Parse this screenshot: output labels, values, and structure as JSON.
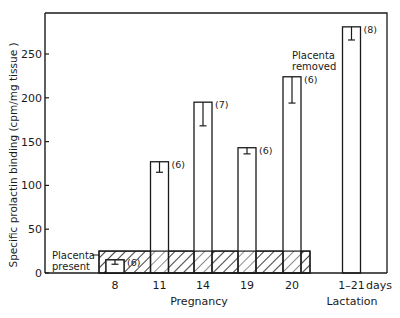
{
  "chart_data": {
    "type": "bar",
    "title": "",
    "xlabel_groups": [
      {
        "label": "Pregnancy",
        "categories": [
          "8",
          "11",
          "14",
          "19",
          "20"
        ]
      },
      {
        "label": "Lactation",
        "categories": [
          "1–21"
        ]
      }
    ],
    "x_unit_label": "days",
    "ylabel": "Specific prolactin binding  (cpm/mg tissue )",
    "ylim": [
      0,
      290
    ],
    "yticks": [
      0,
      50,
      100,
      150,
      200,
      250
    ],
    "categories": [
      "8",
      "11",
      "14",
      "19",
      "20",
      "1–21"
    ],
    "values": [
      15,
      127,
      195,
      143,
      224,
      281
    ],
    "error_lower": [
      5,
      12,
      27,
      7,
      30,
      15
    ],
    "n_labels": [
      "(6)",
      "(6)",
      "(7)",
      "(6)",
      "(6)",
      "(8)"
    ],
    "annotations": [
      {
        "text": "Placenta removed",
        "position": "above pregnancy bars 14–20"
      },
      {
        "text": "Placenta present",
        "position": "hatched region from day 8 to day 20, up to ~25"
      }
    ],
    "hatched_region": {
      "x_from": "8",
      "x_to": "20",
      "y_top": 25
    },
    "grid": false,
    "legend": null
  },
  "labels": {
    "placenta_removed_1": "Placenta",
    "placenta_removed_2": "removed",
    "placenta_present_1": "Placenta",
    "placenta_present_2": "present",
    "pregnancy": "Pregnancy",
    "lactation": "Lactation",
    "days": "days",
    "ylabel": "Specific prolactin binding  (cpm/mg tissue )"
  }
}
